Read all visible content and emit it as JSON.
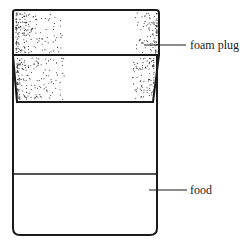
{
  "figure": {
    "type": "labeled-diagram",
    "colors": {
      "line": "#1a1a1a",
      "background": "#ffffff",
      "stipple": "#2a2a2a"
    }
  },
  "labels": {
    "foam_plug": "foam plug",
    "food": "food"
  },
  "parts": [
    {
      "name": "foam plug",
      "description": "stippled tapered plug inserted in container top"
    },
    {
      "name": "container",
      "description": "rectangular vial with rounded bottom corners"
    },
    {
      "name": "food",
      "description": "layer at container bottom marked by horizontal line"
    }
  ]
}
